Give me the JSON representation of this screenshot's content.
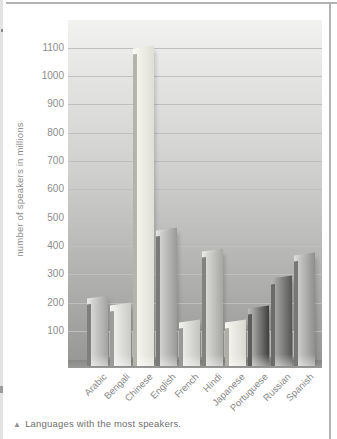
{
  "figure": {
    "caption_marker": "▲",
    "caption_text": "Languages with the most speakers."
  },
  "chart_data": {
    "type": "bar",
    "title": "",
    "caption": "Languages with the most speakers.",
    "xlabel": "",
    "ylabel": "number of speakers in millions",
    "categories": [
      "Arabic",
      "Bengali",
      "Chinese",
      "English",
      "French",
      "Hindi",
      "Japanese",
      "Portuguese",
      "Russian",
      "Spanish"
    ],
    "values": [
      210,
      185,
      1090,
      450,
      125,
      375,
      125,
      175,
      280,
      360
    ],
    "yticks": [
      1100,
      1000,
      900,
      800,
      700,
      600,
      500,
      400,
      300,
      200,
      100
    ],
    "ylim": [
      0,
      1150
    ],
    "grid": true,
    "legend": false,
    "colors": {
      "wall_top": "#f2f2f0",
      "wall_bottom": "#989896",
      "floor": "#8a8a88",
      "gridline": "#bfbfbf",
      "axis_text": "#8c8c8c",
      "caption_text": "#6f6f6f",
      "border": "#b2b2b2"
    },
    "bar_styles": [
      {
        "side": "#7f7f7d",
        "face_left": "#d8d8d6",
        "face_right": "#a2a2a0",
        "cap": "#eaeae8"
      },
      {
        "side": "#9c9c9a",
        "face_left": "#eeeeec",
        "face_right": "#c9c9c5",
        "cap": "#f5f5f3"
      },
      {
        "side": "#b5b4ab",
        "face_left": "#f5f4ed",
        "face_right": "#e0dfd5",
        "cap": "#faf9f3"
      },
      {
        "side": "#7a7a78",
        "face_left": "#d2d2d0",
        "face_right": "#999997",
        "cap": "#e5e5e3"
      },
      {
        "side": "#999997",
        "face_left": "#e9e9e6",
        "face_right": "#c4c4c0",
        "cap": "#f2f2ef"
      },
      {
        "side": "#82827f",
        "face_left": "#d8d8d5",
        "face_right": "#a6a6a3",
        "cap": "#ebebe8"
      },
      {
        "side": "#aeada6",
        "face_left": "#f2f1eb",
        "face_right": "#d9d8d0",
        "cap": "#f8f7f2"
      },
      {
        "side": "#5d5d5b",
        "face_left": "#a9a9a7",
        "face_right": "#3f3f3d",
        "cap": "#bdbdbb"
      },
      {
        "side": "#6b6b69",
        "face_left": "#a5a5a3",
        "face_right": "#565654",
        "cap": "#b8b8b6"
      },
      {
        "side": "#787876",
        "face_left": "#cccccb",
        "face_right": "#8e8e8c",
        "cap": "#e0e0de"
      }
    ]
  }
}
